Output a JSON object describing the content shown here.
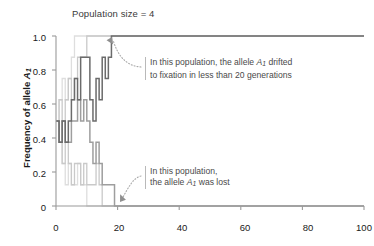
{
  "title": "Population size = 4",
  "axes": {
    "y_title_prefix": "Frequency of allele ",
    "y_title_allele": "A",
    "y_title_sub": "1",
    "y_ticks": [
      "1.0",
      "0.8",
      "0.6",
      "0.4",
      "0.2",
      "0"
    ],
    "x_ticks": [
      "0",
      "20",
      "40",
      "60",
      "80",
      "100"
    ]
  },
  "annotations": {
    "fixation": {
      "line1_a": "In this population, the allele ",
      "line1_allele": "A",
      "line1_sub": "1",
      "line1_b": " drifted",
      "line2": "to fixation in less than 20 generations"
    },
    "lost": {
      "line1": "In this population,",
      "line2_a": "the allele ",
      "line2_allele": "A",
      "line2_sub": "1",
      "line2_b": " was lost"
    }
  },
  "colors": {
    "axis": "#9a9a9a",
    "text": "#1a1a1a",
    "title_text": "#3a3a3a",
    "annotation_text": "#4a4a4a",
    "annotation_rule": "#b9b9b9",
    "trace_dark": "#6b6b6b",
    "trace_medium": "#9e9e9e",
    "trace_light": "#c9c9c9",
    "trace_lightest": "#dedede",
    "leader": "#a8a8a8"
  },
  "chart_data": {
    "type": "line",
    "title": "Population size = 4",
    "xlabel": "",
    "ylabel": "Frequency of allele A1",
    "xlim": [
      0,
      100
    ],
    "ylim": [
      0,
      1.0
    ],
    "grid": false,
    "legend": "none",
    "x_tick_values": [
      0,
      20,
      40,
      60,
      80,
      100
    ],
    "y_tick_values": [
      0,
      0.2,
      0.4,
      0.6,
      0.8,
      1.0
    ],
    "step_style": "post",
    "annotations": [
      {
        "text": "In this population, the allele A1 drifted to fixation in less than 20 generations",
        "target_x": 19,
        "target_y": 1.0
      },
      {
        "text": "In this population, the allele A1 was lost",
        "target_x": 22,
        "target_y": 0.0
      }
    ],
    "series": [
      {
        "name": "population-fixed",
        "color": "#6b6b6b",
        "outcome": "fixation",
        "x": [
          0,
          1,
          2,
          3,
          4,
          5,
          6,
          7,
          8,
          9,
          10,
          11,
          12,
          13,
          14,
          15,
          16,
          17,
          18,
          19,
          20,
          100
        ],
        "values": [
          0.5,
          0.375,
          0.5,
          0.375,
          0.5,
          0.625,
          0.75,
          0.625,
          0.875,
          0.875,
          0.875,
          0.625,
          0.5,
          0.75,
          0.625,
          0.875,
          0.75,
          0.875,
          1.0,
          1.0,
          1.0,
          1.0
        ]
      },
      {
        "name": "population-lost",
        "color": "#9e9e9e",
        "outcome": "loss",
        "x": [
          0,
          1,
          2,
          3,
          4,
          5,
          6,
          7,
          8,
          9,
          10,
          11,
          12,
          13,
          14,
          15,
          16,
          17,
          18,
          19,
          20,
          21,
          22,
          100
        ],
        "values": [
          0.5,
          0.375,
          0.5,
          0.375,
          0.375,
          0.5,
          0.5,
          0.625,
          0.5,
          0.625,
          0.5,
          0.375,
          0.25,
          0.375,
          0.25,
          0.125,
          0.125,
          0.125,
          0.125,
          0.0,
          0.0,
          0.0,
          0.0,
          0.0
        ]
      },
      {
        "name": "population-light-rising",
        "color": "#c9c9c9",
        "outcome": "fixation",
        "x": [
          0,
          1,
          2,
          3,
          4,
          5,
          6,
          7,
          8,
          9,
          10,
          11,
          100
        ],
        "values": [
          0.5,
          0.625,
          0.5,
          0.625,
          0.75,
          0.625,
          0.75,
          0.875,
          0.875,
          0.875,
          1.0,
          1.0,
          1.0
        ]
      },
      {
        "name": "population-light-falling-a",
        "color": "#c9c9c9",
        "outcome": "loss",
        "x": [
          0,
          1,
          2,
          3,
          4,
          5,
          6,
          7,
          8,
          9,
          10,
          11,
          12,
          13,
          14,
          15,
          16,
          17,
          100
        ],
        "values": [
          0.5,
          0.375,
          0.25,
          0.375,
          0.25,
          0.125,
          0.25,
          0.25,
          0.125,
          0.25,
          0.125,
          0.125,
          0.125,
          0.25,
          0.125,
          0.0,
          0.0,
          0.0,
          0.0
        ]
      },
      {
        "name": "population-light-falling-b",
        "color": "#dedede",
        "outcome": "loss",
        "x": [
          0,
          1,
          2,
          3,
          4,
          5,
          6,
          7,
          8,
          9,
          10,
          11,
          12,
          13,
          100
        ],
        "values": [
          0.5,
          0.375,
          0.25,
          0.125,
          0.25,
          0.125,
          0.125,
          0.25,
          0.125,
          0.125,
          0.0,
          0.0,
          0.0,
          0.0,
          0.0
        ]
      },
      {
        "name": "population-lightest-rising",
        "color": "#dedede",
        "outcome": "fixation",
        "x": [
          0,
          1,
          2,
          3,
          4,
          5,
          6,
          7,
          100
        ],
        "values": [
          0.5,
          0.625,
          0.75,
          0.625,
          0.75,
          0.875,
          1.0,
          1.0,
          1.0
        ]
      }
    ]
  }
}
